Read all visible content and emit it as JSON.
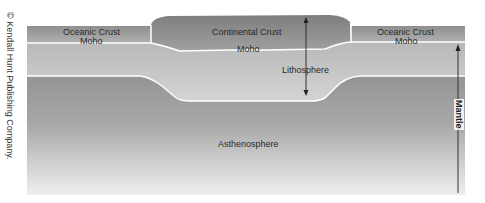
{
  "diagram": {
    "credit": "© Kendall Hunt Publishing Company.",
    "labels": {
      "oceanic_crust_left": "Oceanic Crust",
      "moho_left": "Moho",
      "continental_crust": "Continental Crust",
      "moho_center": "Moho",
      "oceanic_crust_right": "Oceanic Crust",
      "moho_right": "Moho",
      "lithosphere": "Lithosphere",
      "asthenosphere": "Asthenosphere",
      "mantle": "Mantle"
    },
    "colors": {
      "oceanic_crust": "#9a9a9a",
      "continental_crust": "#8c8c8c",
      "lithosphere": "#c2c2c2",
      "asthenosphere_top": "#8a8a8a",
      "asthenosphere_bottom": "#ececec",
      "boundary": "#ffffff",
      "arrow": "#222222"
    }
  }
}
